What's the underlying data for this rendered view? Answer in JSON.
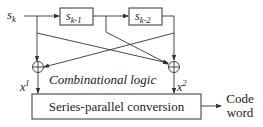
{
  "diagram": {
    "input": {
      "base": "s",
      "sub": "k"
    },
    "register1": {
      "base": "s",
      "sub": "k-1"
    },
    "register2": {
      "base": "s",
      "sub": "k-2"
    },
    "logic_label": "Combinational logic",
    "output1": {
      "base": "x",
      "sup": "1"
    },
    "output2": {
      "base": "x",
      "sup": "2"
    },
    "converter_label": "Series-parallel conversion",
    "result_line1": "Code",
    "result_line2": "word",
    "xor_symbol": "xor-adder"
  }
}
